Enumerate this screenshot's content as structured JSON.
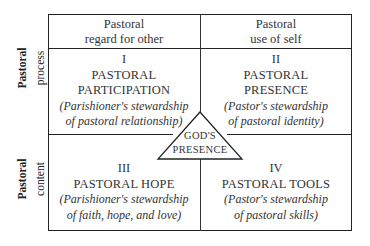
{
  "diagram": {
    "column_headers": [
      {
        "line1": "Pastoral",
        "line2": "regard for other"
      },
      {
        "line1": "Pastoral",
        "line2": "use of self"
      }
    ],
    "row_labels": [
      {
        "line1": "Pastoral",
        "line2": "process"
      },
      {
        "line1": "Pastoral",
        "line2": "content"
      }
    ],
    "quadrants": [
      {
        "numeral": "I",
        "title_line1": "PASTORAL",
        "title_line2": "PARTICIPATION",
        "desc_line1": "(Parishioner's stewardship",
        "desc_line2": "of pastoral relationship)"
      },
      {
        "numeral": "II",
        "title_line1": "PASTORAL",
        "title_line2": "PRESENCE",
        "desc_line1": "(Pastor's stewardship",
        "desc_line2": "of pastoral identity)"
      },
      {
        "numeral": "III",
        "title_line1": "PASTORAL HOPE",
        "desc_line1": "(Parishioner's stewardship",
        "desc_line2": "of faith, hope, and love)"
      },
      {
        "numeral": "IV",
        "title_line1": "PASTORAL TOOLS",
        "desc_line1": "(Pastor's stewardship",
        "desc_line2": "of pastoral skills)"
      }
    ],
    "center": {
      "line1": "GOD'S",
      "line2": "PRESENCE",
      "shape": "triangle"
    },
    "colors": {
      "line": "#222222",
      "text": "#333333",
      "background": "#ffffff"
    }
  }
}
